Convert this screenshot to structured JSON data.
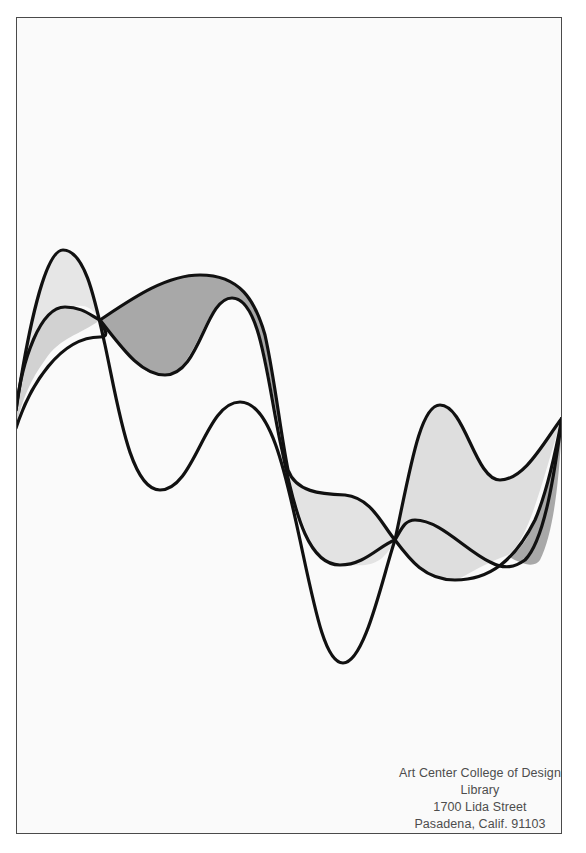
{
  "artwork": {
    "description": "Three intertwining sinuous curves with shaded regions between them",
    "colors": {
      "background": "#fafafa",
      "frame_border": "#4a4a4a",
      "stroke": "#111111",
      "fill_light": "#e6e6e6",
      "fill_medium": "#d6d6d6",
      "fill_dark": "#a6a6a6"
    }
  },
  "caption": {
    "line1": "Art Center College of Design",
    "line2": "Library",
    "line3": "1700 Lida Street",
    "line4": "Pasadena, Calif. 91103"
  }
}
